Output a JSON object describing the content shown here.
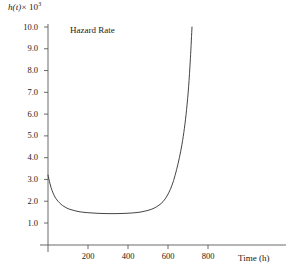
{
  "chart_data": {
    "type": "line",
    "title": "",
    "annotation": "Hazard Rate",
    "ylabel_fn": "h(t)",
    "ylabel_mult": "× 10",
    "ylabel_exp": "3",
    "xlabel": "Time (h)",
    "xlim": [
      0,
      900
    ],
    "ylim": [
      0,
      10.6
    ],
    "xticks": [
      200,
      400,
      600,
      800
    ],
    "xtick_labels": [
      "200",
      "400",
      "600",
      "800"
    ],
    "yticks": [
      1.0,
      2.0,
      3.0,
      4.0,
      5.0,
      6.0,
      7.0,
      8.0,
      9.0,
      10.0
    ],
    "ytick_labels": [
      "1.0",
      "2.0",
      "3.0",
      "4.0",
      "5.0",
      "6.0",
      "7.0",
      "8.0",
      "9.0",
      "10.0"
    ],
    "grid": false,
    "legend": "none",
    "series": [
      {
        "name": "Hazard Rate",
        "color": "#3a3a3a",
        "x": [
          0,
          10,
          20,
          30,
          40,
          50,
          65,
          80,
          100,
          120,
          150,
          180,
          220,
          260,
          300,
          340,
          380,
          420,
          460,
          500,
          530,
          555,
          575,
          595,
          612,
          628,
          643,
          657,
          670,
          682,
          693,
          703,
          712,
          720
        ],
        "y": [
          3.2,
          2.8,
          2.5,
          2.28,
          2.12,
          2.0,
          1.86,
          1.76,
          1.66,
          1.6,
          1.53,
          1.49,
          1.46,
          1.44,
          1.43,
          1.43,
          1.44,
          1.46,
          1.5,
          1.58,
          1.68,
          1.82,
          1.98,
          2.24,
          2.55,
          2.95,
          3.45,
          4.0,
          4.62,
          5.35,
          6.22,
          7.25,
          8.55,
          10.0
        ]
      }
    ]
  },
  "axes": {
    "y_axis_name": "vertical-axis",
    "x_axis_name": "horizontal-axis"
  }
}
